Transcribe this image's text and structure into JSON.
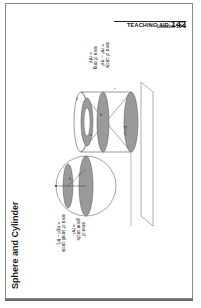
{
  "header": {
    "aid_label": "TEACHING AID",
    "aid_number": "142",
    "lesson": "Lesson 10-8"
  },
  "title": "Sphere and Cylinder",
  "diagram": {
    "cylinder_labels": {
      "circle": [
        "area of circle",
        "= πr² − πx²"
      ],
      "ring": [
        "area of ring",
        "= πh²"
      ]
    },
    "sphere_labels": {
      "small_circle": [
        "area of small circle",
        "= π(r² − h²)"
      ],
      "great_circle": [
        "area of",
        "great circle",
        "= πr²"
      ]
    },
    "variables": [
      "h",
      "r",
      "x",
      "h",
      "r"
    ]
  },
  "colors": {
    "shade": "#9a9a9a",
    "line": "#555555",
    "shadow": "#6a6a6a"
  }
}
